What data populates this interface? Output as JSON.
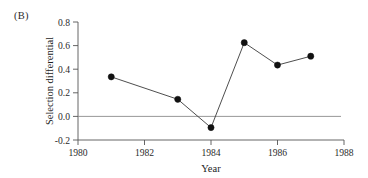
{
  "panel": {
    "label": "(B)"
  },
  "chart_data": {
    "type": "line",
    "title": "",
    "subtitle": "",
    "xlabel": "Year",
    "ylabel": "Selection differential",
    "x": [
      1981,
      1983,
      1984,
      1985,
      1986,
      1987
    ],
    "values": [
      0.335,
      0.145,
      -0.095,
      0.625,
      0.435,
      0.51
    ],
    "series": [
      {
        "name": "Selection differential",
        "values": [
          0.335,
          0.145,
          -0.095,
          0.625,
          0.435,
          0.51
        ]
      }
    ],
    "xlim": [
      1980,
      1988
    ],
    "ylim": [
      -0.2,
      0.8
    ],
    "xticks": [
      1980,
      1982,
      1984,
      1986,
      1988
    ],
    "xticklabels": [
      "1980",
      "1982",
      "1984",
      "1986",
      "1988"
    ],
    "yticks": [
      -0.2,
      0.0,
      0.2,
      0.4,
      0.6,
      0.8
    ],
    "yticklabels": [
      "-0.2",
      "0.0",
      "0.2",
      "0.4",
      "0.6",
      "0.8"
    ],
    "grid": false,
    "legend": "none",
    "annotations": [
      {
        "name": "zero-reference-line",
        "y": 0.0
      }
    ],
    "marker": "filled-circle",
    "line_color": "#3a3a3a",
    "marker_color": "#111111",
    "zero_line_color": "#8c8c8c",
    "axis_color": "#555555",
    "background_color": "#ffffff"
  }
}
